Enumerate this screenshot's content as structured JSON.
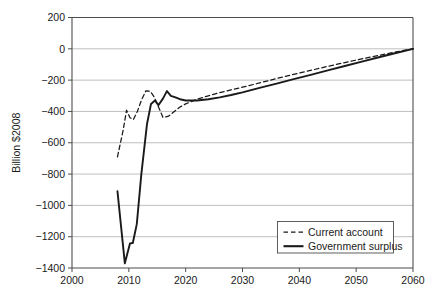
{
  "chart_data": {
    "type": "line",
    "title": "",
    "xlabel": "",
    "ylabel": "Billion $2008",
    "xlim": [
      2000,
      2060
    ],
    "ylim": [
      -1400,
      200
    ],
    "xticks": [
      "2000",
      "2010",
      "2020",
      "2030",
      "2040",
      "2050",
      "2060"
    ],
    "yticks": [
      "200",
      "0",
      "−200",
      "−400",
      "−600",
      "−800",
      "−1000",
      "−1200",
      "−1400"
    ],
    "ytick_values": [
      200,
      0,
      -200,
      -400,
      -600,
      -800,
      -1000,
      -1200,
      -1400
    ],
    "xtick_values": [
      2000,
      2010,
      2020,
      2030,
      2040,
      2050,
      2060
    ],
    "grid": true,
    "legend_position": "lower right",
    "series": [
      {
        "name": "Current account",
        "style": "dashed",
        "color": "#1a1a1a",
        "x": [
          2008,
          2009,
          2009.6,
          2010.2,
          2010.8,
          2011.5,
          2012.2,
          2013,
          2013.8,
          2014.5,
          2015.2,
          2016,
          2017,
          2018,
          2019,
          2020,
          2022,
          2024,
          2026,
          2028,
          2030,
          2033,
          2036,
          2039,
          2042,
          2045,
          2048,
          2051,
          2054,
          2057,
          2060
        ],
        "y": [
          -690,
          -520,
          -392,
          -440,
          -452,
          -400,
          -330,
          -268,
          -272,
          -310,
          -370,
          -438,
          -430,
          -400,
          -372,
          -352,
          -322,
          -300,
          -280,
          -262,
          -245,
          -218,
          -190,
          -163,
          -138,
          -112,
          -88,
          -64,
          -42,
          -20,
          0
        ]
      },
      {
        "name": "Government surplus",
        "style": "solid",
        "color": "#1a1a1a",
        "x": [
          2008,
          2009.3,
          2010.2,
          2010.7,
          2011.4,
          2012.2,
          2013.2,
          2013.9,
          2014.6,
          2015.2,
          2016,
          2016.7,
          2017.4,
          2018.2,
          2019,
          2020,
          2022,
          2024,
          2026,
          2028,
          2030,
          2033,
          2036,
          2039,
          2042,
          2045,
          2048,
          2051,
          2054,
          2057,
          2060
        ],
        "y": [
          -910,
          -1370,
          -1243,
          -1240,
          -1120,
          -800,
          -480,
          -352,
          -330,
          -360,
          -318,
          -270,
          -300,
          -310,
          -322,
          -330,
          -330,
          -322,
          -310,
          -295,
          -278,
          -250,
          -222,
          -194,
          -166,
          -138,
          -110,
          -82,
          -54,
          -27,
          0
        ]
      }
    ],
    "legend": [
      {
        "label": "Current account",
        "style": "dashed"
      },
      {
        "label": "Government surplus",
        "style": "solid"
      }
    ],
    "colors": {
      "line": "#1a1a1a",
      "grid": "#b8b8b8",
      "axis": "#4d4d4d",
      "background": "#ffffff",
      "legend_border": "#4d4d4d"
    }
  }
}
